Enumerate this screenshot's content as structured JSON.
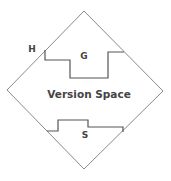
{
  "diagram": {
    "title": "Version Space",
    "labels": {
      "hypothesis_space": "H",
      "general_boundary": "G",
      "specific_boundary": "S",
      "center": "Version Space"
    },
    "colors": {
      "line": "#8a8a8a",
      "boundary": "#555555",
      "text": "#444444",
      "background": "#ffffff"
    }
  }
}
